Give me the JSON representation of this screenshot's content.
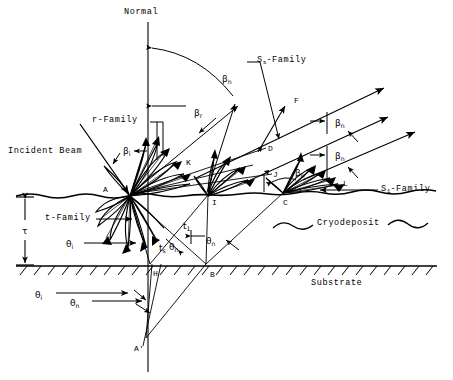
{
  "diagram": {
    "type": "optical-scattering-schematic",
    "background": "#ffffff",
    "ink": "#000000"
  },
  "labels": {
    "normal": "Normal",
    "incident_beam": "Incident Beam",
    "r_family": "r-Family",
    "t_family": "t-Family",
    "ss_family_pre": "S",
    "ss_family_sub": "s",
    "ss_family_post": "-Family",
    "s1_family_pre": "S",
    "s1_family_sub": "1",
    "s1_family_post": "-Family",
    "cryodeposit": "Cryodeposit",
    "substrate": "Substrate"
  },
  "greek": {
    "beta": "β",
    "theta": "θ",
    "tau": "τ",
    "t": "t"
  },
  "angle_labels": [
    {
      "id": "beta-n-arc",
      "base": "β",
      "sub": "n",
      "x": 222,
      "y": 75
    },
    {
      "id": "beta-r",
      "base": "β",
      "sub": "r",
      "x": 194,
      "y": 109
    },
    {
      "id": "beta-i",
      "base": "β",
      "sub": "i",
      "x": 123,
      "y": 147
    },
    {
      "id": "beta-n-1",
      "base": "β",
      "sub": "n",
      "x": 335,
      "y": 119
    },
    {
      "id": "beta-n-2",
      "base": "β",
      "sub": "n",
      "x": 335,
      "y": 152
    },
    {
      "id": "beta-n-3",
      "base": "β",
      "sub": "n",
      "x": 295,
      "y": 169
    },
    {
      "id": "theta-i-mid",
      "base": "θ",
      "sub": "i",
      "x": 66,
      "y": 240
    },
    {
      "id": "theta-n-a",
      "base": "θ",
      "sub": "n",
      "x": 169,
      "y": 243
    },
    {
      "id": "theta-n-b",
      "base": "θ",
      "sub": "n",
      "x": 206,
      "y": 237
    },
    {
      "id": "theta-i-low",
      "base": "θ",
      "sub": "i",
      "x": 35,
      "y": 291
    },
    {
      "id": "theta-n-low",
      "base": "θ",
      "sub": "n",
      "x": 70,
      "y": 299
    },
    {
      "id": "t-1",
      "base": "t",
      "sub": "1",
      "x": 183,
      "y": 222
    },
    {
      "id": "t-s",
      "base": "t",
      "sub": "s",
      "x": 159,
      "y": 244
    },
    {
      "id": "tau",
      "base": "τ",
      "sub": "",
      "x": 22,
      "y": 227
    }
  ],
  "points": [
    {
      "id": "A",
      "text": "A",
      "x": 103,
      "y": 186
    },
    {
      "id": "K",
      "text": "K",
      "x": 186,
      "y": 159
    },
    {
      "id": "I",
      "text": "I",
      "x": 212,
      "y": 199
    },
    {
      "id": "F",
      "text": "F",
      "x": 294,
      "y": 97
    },
    {
      "id": "D",
      "text": "D",
      "x": 268,
      "y": 145
    },
    {
      "id": "J",
      "text": "J",
      "x": 273,
      "y": 171
    },
    {
      "id": "C",
      "text": "C",
      "x": 283,
      "y": 199
    },
    {
      "id": "L",
      "text": "L",
      "x": 343,
      "y": 180
    },
    {
      "id": "H",
      "text": "H",
      "x": 153,
      "y": 270
    },
    {
      "id": "B",
      "text": "B",
      "x": 210,
      "y": 271
    },
    {
      "id": "Ap",
      "text": "A'",
      "x": 134,
      "y": 345
    }
  ],
  "geometry": {
    "surface_y": 196,
    "substrate_y": 266,
    "normal_x": 148,
    "origin_A": {
      "x": 130,
      "y": 196
    },
    "node_I": {
      "x": 208,
      "y": 196
    },
    "node_C": {
      "x": 282,
      "y": 192
    },
    "point_H": {
      "x": 150,
      "y": 265
    },
    "point_B": {
      "x": 206,
      "y": 265
    },
    "point_Aprime": {
      "x": 146,
      "y": 340
    }
  }
}
